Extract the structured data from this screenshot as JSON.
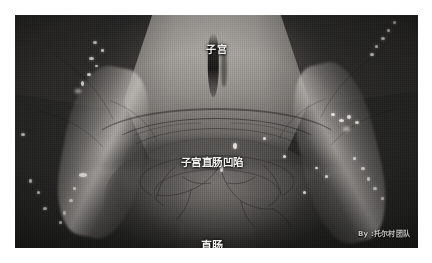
{
  "image": {
    "kind": "surgical-photograph",
    "subject": "female pelvic anatomy, open/laparoscopic intraoperative view",
    "tone": "desaturated grayscale",
    "frame": {
      "background_color": "#ffffff",
      "photo_left": 15,
      "photo_top": 15,
      "photo_width": 403,
      "photo_height": 233
    }
  },
  "annotations": {
    "label_color": "#f2f1ee",
    "items": [
      {
        "id": "uterus",
        "text": "子宫",
        "translation": "uterus",
        "position": "top-center"
      },
      {
        "id": "rectouterine-pouch",
        "text": "子宫直肠凹陷",
        "translation": "rectouterine pouch (pouch of Douglas)",
        "position": "middle-center"
      },
      {
        "id": "rectum",
        "text": "直肠",
        "translation": "rectum",
        "position": "bottom-center"
      }
    ]
  },
  "watermark": {
    "text": "By :托尔村团队",
    "position": "bottom-right",
    "color": "#e8e6e2"
  }
}
